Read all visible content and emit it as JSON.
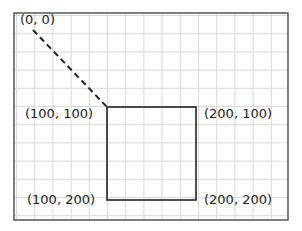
{
  "diagram": {
    "frame": {
      "x": 14,
      "y": 13,
      "w": 274,
      "h": 207,
      "color": "#555555"
    },
    "grid": {
      "spacing": 18.2,
      "origin_x": 16.5,
      "origin_y": 15.5,
      "color": "#d9d9d9"
    },
    "dashed_line": {
      "x1": 33,
      "y1": 30,
      "x2": 107,
      "y2": 107,
      "color": "#222222"
    },
    "square": {
      "x": 107,
      "y": 107,
      "w": 89,
      "h": 93,
      "color": "#222222"
    },
    "labels": [
      {
        "text": "(0, 0)",
        "x": 20,
        "y": 12
      },
      {
        "text": "(100, 100)",
        "x": 25,
        "y": 106
      },
      {
        "text": "(200, 100)",
        "x": 204,
        "y": 106
      },
      {
        "text": "(100, 200)",
        "x": 27,
        "y": 192
      },
      {
        "text": "(200, 200)",
        "x": 204,
        "y": 192
      }
    ]
  }
}
